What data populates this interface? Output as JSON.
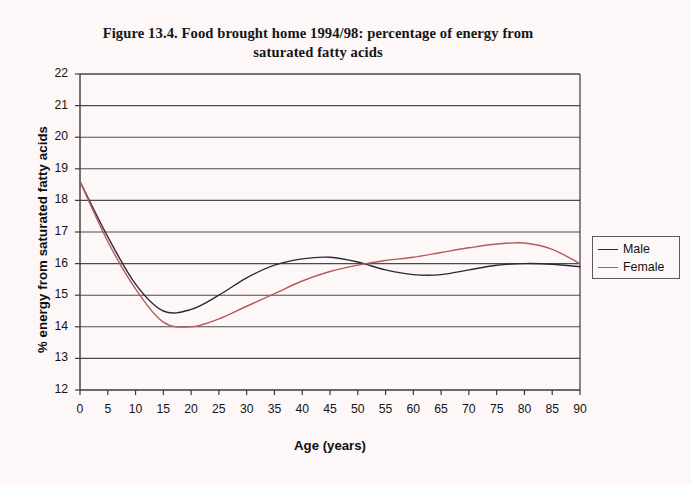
{
  "chart_data": {
    "type": "line",
    "title": "Figure 13.4. Food brought home 1994/98: percentage of energy from saturated fatty acids",
    "title_lines": [
      "Figure 13.4. Food brought home 1994/98: percentage of energy from",
      "saturated fatty acids"
    ],
    "xlabel": "Age (years)",
    "ylabel": "% energy from saturated fatty acids",
    "xlim": [
      0,
      90
    ],
    "ylim": [
      12,
      22
    ],
    "grid": "horizontal",
    "legend_position": "right-outside",
    "xticks": [
      0,
      5,
      10,
      15,
      20,
      25,
      30,
      35,
      40,
      45,
      50,
      55,
      60,
      65,
      70,
      75,
      80,
      85,
      90
    ],
    "yticks": [
      12,
      13,
      14,
      15,
      16,
      17,
      18,
      19,
      20,
      21,
      22
    ],
    "x": [
      0,
      5,
      10,
      15,
      20,
      25,
      30,
      35,
      40,
      45,
      50,
      55,
      60,
      65,
      70,
      75,
      80,
      85,
      90
    ],
    "series": [
      {
        "name": "Male",
        "color": "#2a2a3c",
        "values": [
          18.6,
          16.85,
          15.35,
          14.5,
          14.55,
          15.0,
          15.55,
          15.95,
          16.15,
          16.2,
          16.05,
          15.8,
          15.65,
          15.65,
          15.8,
          15.95,
          16.0,
          15.98,
          15.9
        ]
      },
      {
        "name": "Female",
        "color": "#b55a5a",
        "values": [
          18.6,
          16.7,
          15.2,
          14.15,
          14.0,
          14.25,
          14.65,
          15.05,
          15.45,
          15.75,
          15.95,
          16.1,
          16.2,
          16.35,
          16.5,
          16.62,
          16.65,
          16.45,
          16.0
        ]
      }
    ],
    "legend": [
      {
        "label": "Male",
        "color": "#2a2a3c"
      },
      {
        "label": "Female",
        "color": "#b55a5a"
      }
    ],
    "colors": {
      "male": "#2a2a3c",
      "female": "#b55a5a",
      "gridline": "#4a4a4a",
      "axis": "#3a3a3a",
      "background": "#fdf7f7"
    }
  }
}
